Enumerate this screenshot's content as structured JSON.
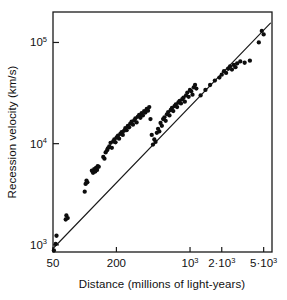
{
  "chart_data": {
    "type": "scatter",
    "title": "",
    "xlabel": "Distance (millions of light-years)",
    "ylabel": "Recession velocity (km/s)",
    "xscale": "log",
    "yscale": "log",
    "xlim": [
      50,
      6000
    ],
    "ylim": [
      850,
      200000
    ],
    "grid": false,
    "legend": null,
    "xticks": [
      {
        "value": 50,
        "label_mantissa": "50",
        "label_exponent": ""
      },
      {
        "value": 200,
        "label_mantissa": "200",
        "label_exponent": ""
      },
      {
        "value": 1000,
        "label_mantissa": "10",
        "label_exponent": "3"
      },
      {
        "value": 2000,
        "label_mantissa": "2·10",
        "label_exponent": "3"
      },
      {
        "value": 5000,
        "label_mantissa": "5·10",
        "label_exponent": "3"
      }
    ],
    "yticks": [
      {
        "value": 1000,
        "label_mantissa": "10",
        "label_exponent": "3"
      },
      {
        "value": 10000,
        "label_mantissa": "10",
        "label_exponent": "4"
      },
      {
        "value": 100000,
        "label_mantissa": "10",
        "label_exponent": "5"
      }
    ],
    "fit_line": {
      "name": "Hubble law fit",
      "x": [
        50,
        5800
      ],
      "y": [
        920,
        155000
      ]
    },
    "series": [
      {
        "name": "galaxies",
        "marker": "filled-circle",
        "color": "#0d0d0d",
        "points": [
          [
            51,
            880
          ],
          [
            53,
            1020
          ],
          [
            54,
            1230
          ],
          [
            66,
            1780
          ],
          [
            67,
            1950
          ],
          [
            69,
            1840
          ],
          [
            100,
            3350
          ],
          [
            102,
            4000
          ],
          [
            104,
            4300
          ],
          [
            106,
            4150
          ],
          [
            117,
            5400
          ],
          [
            120,
            5150
          ],
          [
            123,
            5600
          ],
          [
            126,
            5300
          ],
          [
            128,
            5750
          ],
          [
            131,
            5500
          ],
          [
            133,
            6000
          ],
          [
            136,
            5900
          ],
          [
            150,
            7400
          ],
          [
            154,
            7100
          ],
          [
            158,
            8200
          ],
          [
            163,
            8600
          ],
          [
            166,
            9000
          ],
          [
            171,
            9400
          ],
          [
            176,
            10200
          ],
          [
            181,
            9100
          ],
          [
            186,
            10500
          ],
          [
            191,
            11000
          ],
          [
            196,
            10300
          ],
          [
            201,
            11500
          ],
          [
            207,
            12000
          ],
          [
            212,
            11200
          ],
          [
            218,
            12500
          ],
          [
            224,
            13000
          ],
          [
            230,
            12200
          ],
          [
            236,
            13400
          ],
          [
            243,
            14200
          ],
          [
            250,
            13600
          ],
          [
            257,
            15000
          ],
          [
            264,
            14500
          ],
          [
            271,
            15800
          ],
          [
            279,
            16500
          ],
          [
            287,
            15400
          ],
          [
            295,
            17000
          ],
          [
            303,
            17800
          ],
          [
            311,
            16200
          ],
          [
            320,
            18500
          ],
          [
            329,
            19200
          ],
          [
            338,
            18000
          ],
          [
            347,
            20000
          ],
          [
            357,
            19000
          ],
          [
            367,
            21000
          ],
          [
            377,
            20300
          ],
          [
            388,
            22000
          ],
          [
            399,
            21200
          ],
          [
            410,
            23000
          ],
          [
            421,
            17500
          ],
          [
            433,
            12200
          ],
          [
            445,
            9800
          ],
          [
            458,
            11000
          ],
          [
            470,
            10400
          ],
          [
            484,
            12800
          ],
          [
            497,
            14000
          ],
          [
            511,
            13200
          ],
          [
            525,
            16000
          ],
          [
            540,
            15000
          ],
          [
            555,
            17500
          ],
          [
            571,
            18200
          ],
          [
            587,
            16800
          ],
          [
            603,
            19500
          ],
          [
            620,
            20500
          ],
          [
            638,
            19000
          ],
          [
            656,
            21500
          ],
          [
            674,
            22500
          ],
          [
            693,
            21000
          ],
          [
            713,
            23500
          ],
          [
            733,
            24500
          ],
          [
            754,
            23000
          ],
          [
            775,
            25500
          ],
          [
            797,
            26500
          ],
          [
            820,
            25000
          ],
          [
            843,
            27500
          ],
          [
            867,
            28500
          ],
          [
            892,
            26000
          ],
          [
            917,
            30000
          ],
          [
            943,
            32000
          ],
          [
            970,
            29000
          ],
          [
            998,
            34000
          ],
          [
            1026,
            33000
          ],
          [
            1055,
            30500
          ],
          [
            1085,
            36000
          ],
          [
            1116,
            38000
          ],
          [
            1148,
            35000
          ],
          [
            1260,
            30000
          ],
          [
            1400,
            34000
          ],
          [
            1550,
            38000
          ],
          [
            1720,
            42000
          ],
          [
            1900,
            45000
          ],
          [
            2000,
            48000
          ],
          [
            2100,
            52000
          ],
          [
            2200,
            50000
          ],
          [
            2300,
            55000
          ],
          [
            2400,
            58000
          ],
          [
            2500,
            54000
          ],
          [
            2600,
            60000
          ],
          [
            2700,
            57000
          ],
          [
            2800,
            62000
          ],
          [
            3000,
            65000
          ],
          [
            3300,
            63000
          ],
          [
            3700,
            66000
          ],
          [
            4500,
            100000
          ],
          [
            4800,
            130000
          ],
          [
            5000,
            120000
          ]
        ]
      }
    ]
  },
  "axes": {
    "x_axis_name": "distance-axis",
    "y_axis_name": "recession-velocity-axis"
  }
}
